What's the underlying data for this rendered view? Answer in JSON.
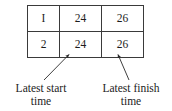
{
  "figure": {
    "type": "annotated-table",
    "background_color": "#ffffff",
    "text_color": "#1c1c1c",
    "border_color": "#3a3a3a"
  },
  "table": {
    "columns": [
      "activity_id",
      "latest_start_time",
      "latest_finish_time"
    ],
    "rows": [
      {
        "id": "I",
        "latest_start": "24",
        "latest_finish": "26"
      },
      {
        "id": "2",
        "latest_start": "24",
        "latest_finish": "26"
      }
    ]
  },
  "annotations": {
    "latest_start": {
      "line1": "Latest start",
      "line2": "time"
    },
    "latest_finish": {
      "line1": "Latest finish",
      "line2": "time"
    }
  }
}
